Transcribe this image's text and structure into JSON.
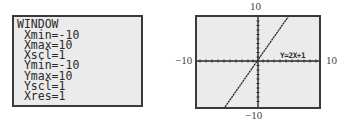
{
  "window_screen": {
    "title": "WINDOW",
    "settings": [
      {
        "name": "Xmin",
        "value": "-10",
        "text": " Xmin=-10"
      },
      {
        "name": "Xmax",
        "value": "10",
        "text": " Xmax=10"
      },
      {
        "name": "Xscl",
        "value": "1",
        "text": " Xscl=1"
      },
      {
        "name": "Ymin",
        "value": "-10",
        "text": " Ymin=-10"
      },
      {
        "name": "Ymax",
        "value": "10",
        "text": " Ymax=10"
      },
      {
        "name": "Yscl",
        "value": "1",
        "text": " Yscl=1"
      },
      {
        "name": "Xres",
        "value": "1",
        "text": " Xres=1"
      }
    ]
  },
  "graph_screen": {
    "equation_label": "Y=2X+1",
    "labels": {
      "top": "10",
      "bottom": "−10",
      "left": "−10",
      "right": "10"
    }
  },
  "colors": {
    "screen_bg": "#ebebeb",
    "border": "#3a3a3a",
    "ink": "#2a2a2a"
  }
}
